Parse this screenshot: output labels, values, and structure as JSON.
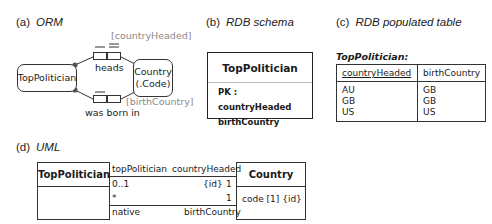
{
  "panels": {
    "orm": {
      "label": "(a)",
      "title": "ORM",
      "entities": {
        "top_politician": "TopPolitician",
        "country_line1": "Country",
        "country_line2": "(.Code)"
      },
      "fact_types": [
        {
          "reading": "heads",
          "role_name": "[countryHeaded]"
        },
        {
          "reading": "was born in",
          "role_name": "[birthCountry]"
        }
      ]
    },
    "rdb_schema": {
      "label": "(b)",
      "title": "RDB schema",
      "table_name": "TopPolitician",
      "rows": [
        "PK : countryHeaded",
        "birthCountry"
      ]
    },
    "rdb_populated": {
      "label": "(c)",
      "title": "RDB populated table",
      "table_name": "TopPolitician:",
      "columns": [
        "countryHeaded",
        "birthCountry"
      ],
      "rows": [
        [
          "AU",
          "GB"
        ],
        [
          "GB",
          "GB"
        ],
        [
          "US",
          "US"
        ]
      ]
    },
    "uml": {
      "label": "(d)",
      "title": "UML",
      "class_left": "TopPolitician",
      "class_right": "Country",
      "class_right_attribute": "code [1] {id}",
      "assoc1": {
        "left_role": "topPolitician",
        "right_role": "countryHeaded",
        "left_mult": "0..1",
        "right_constraint": "{id}",
        "right_mult": "1"
      },
      "assoc2": {
        "left_mult": "*",
        "right_mult": "1",
        "left_role": "native",
        "right_role": "birthCountry"
      }
    }
  }
}
